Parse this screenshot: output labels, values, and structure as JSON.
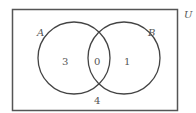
{
  "diagram": {
    "type": "venn",
    "universe_label": "U",
    "sets": [
      {
        "label": "A",
        "only_count": "3"
      },
      {
        "label": "B",
        "only_count": "1"
      }
    ],
    "intersection_count": "0",
    "outside_count": "4"
  },
  "colors": {
    "stroke": "#444444",
    "text": "#555555",
    "background": "#ffffff"
  }
}
